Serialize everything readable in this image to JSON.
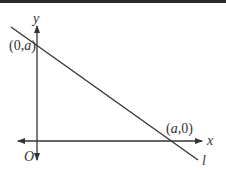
{
  "diagram": {
    "axes": {
      "x_label": "x",
      "y_label": "y",
      "origin_label": "O"
    },
    "line": {
      "name": "l",
      "y_intercept_label": {
        "open": "(0,",
        "var": "a",
        "close": ")"
      },
      "x_intercept_label": {
        "open": "(",
        "var": "a",
        "close": ",0)"
      }
    },
    "colors": {
      "stroke": "#333333",
      "topbar": "#2a2a2a"
    }
  }
}
